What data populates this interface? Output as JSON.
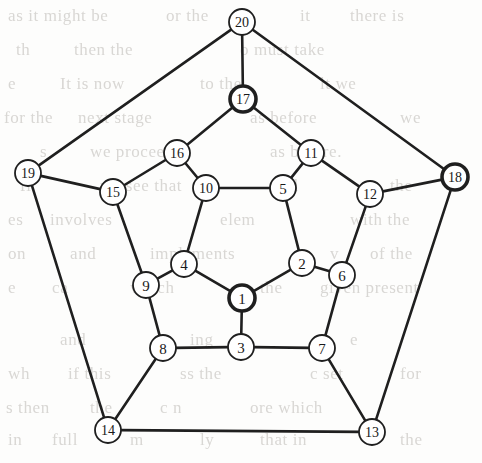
{
  "figure": {
    "width": 482,
    "height": 463,
    "background_color": "#fdfdfc",
    "edge_color": "#1f1f1f",
    "node_fill": "#ffffff",
    "node_stroke": "#1f1f1f",
    "label_color": "#1a1a1a"
  },
  "graph_data": {
    "type": "node-link-diagram",
    "node_count": 20,
    "edge_count": 30,
    "node_radius": 13,
    "highlighted_node_radius": 13,
    "nodes": [
      {
        "id": 1,
        "label": "1",
        "x": 242,
        "y": 298,
        "highlighted": true,
        "ring": "inner"
      },
      {
        "id": 2,
        "label": "2",
        "x": 302,
        "y": 263,
        "highlighted": false,
        "ring": "inner"
      },
      {
        "id": 3,
        "label": "3",
        "x": 241,
        "y": 347,
        "highlighted": false,
        "ring": "middle"
      },
      {
        "id": 4,
        "label": "4",
        "x": 184,
        "y": 264,
        "highlighted": false,
        "ring": "inner"
      },
      {
        "id": 5,
        "label": "5",
        "x": 283,
        "y": 188,
        "highlighted": false,
        "ring": "inner"
      },
      {
        "id": 6,
        "label": "6",
        "x": 342,
        "y": 275,
        "highlighted": false,
        "ring": "middle"
      },
      {
        "id": 7,
        "label": "7",
        "x": 322,
        "y": 348,
        "highlighted": false,
        "ring": "middle"
      },
      {
        "id": 8,
        "label": "8",
        "x": 163,
        "y": 348,
        "highlighted": false,
        "ring": "middle"
      },
      {
        "id": 9,
        "label": "9",
        "x": 146,
        "y": 285,
        "highlighted": false,
        "ring": "middle"
      },
      {
        "id": 10,
        "label": "10",
        "x": 206,
        "y": 188,
        "highlighted": false,
        "ring": "inner"
      },
      {
        "id": 11,
        "label": "11",
        "x": 311,
        "y": 153,
        "highlighted": false,
        "ring": "middle"
      },
      {
        "id": 12,
        "label": "12",
        "x": 370,
        "y": 194,
        "highlighted": false,
        "ring": "middle"
      },
      {
        "id": 13,
        "label": "13",
        "x": 372,
        "y": 432,
        "highlighted": false,
        "ring": "outer"
      },
      {
        "id": 14,
        "label": "14",
        "x": 108,
        "y": 430,
        "highlighted": false,
        "ring": "outer"
      },
      {
        "id": 15,
        "label": "15",
        "x": 113,
        "y": 192,
        "highlighted": false,
        "ring": "middle"
      },
      {
        "id": 16,
        "label": "16",
        "x": 177,
        "y": 153,
        "highlighted": false,
        "ring": "middle"
      },
      {
        "id": 17,
        "label": "17",
        "x": 243,
        "y": 99,
        "highlighted": true,
        "ring": "outer"
      },
      {
        "id": 18,
        "label": "18",
        "x": 455,
        "y": 177,
        "highlighted": true,
        "ring": "outer"
      },
      {
        "id": 19,
        "label": "19",
        "x": 28,
        "y": 173,
        "highlighted": false,
        "ring": "outer"
      },
      {
        "id": 20,
        "label": "20",
        "x": 242,
        "y": 22,
        "highlighted": false,
        "ring": "outer"
      }
    ],
    "edges": [
      {
        "source": 1,
        "target": 2
      },
      {
        "source": 1,
        "target": 3
      },
      {
        "source": 1,
        "target": 4
      },
      {
        "source": 2,
        "target": 5
      },
      {
        "source": 2,
        "target": 6
      },
      {
        "source": 3,
        "target": 7
      },
      {
        "source": 3,
        "target": 8
      },
      {
        "source": 4,
        "target": 9
      },
      {
        "source": 4,
        "target": 10
      },
      {
        "source": 5,
        "target": 10
      },
      {
        "source": 5,
        "target": 11
      },
      {
        "source": 6,
        "target": 7
      },
      {
        "source": 6,
        "target": 12
      },
      {
        "source": 7,
        "target": 13
      },
      {
        "source": 8,
        "target": 9
      },
      {
        "source": 8,
        "target": 14
      },
      {
        "source": 9,
        "target": 15
      },
      {
        "source": 10,
        "target": 16
      },
      {
        "source": 11,
        "target": 12
      },
      {
        "source": 11,
        "target": 17
      },
      {
        "source": 12,
        "target": 18
      },
      {
        "source": 13,
        "target": 14
      },
      {
        "source": 13,
        "target": 18
      },
      {
        "source": 14,
        "target": 19
      },
      {
        "source": 15,
        "target": 16
      },
      {
        "source": 15,
        "target": 19
      },
      {
        "source": 16,
        "target": 17
      },
      {
        "source": 17,
        "target": 20
      },
      {
        "source": 18,
        "target": 20
      },
      {
        "source": 19,
        "target": 20
      }
    ],
    "highlighted_nodes": [
      1,
      17,
      18
    ]
  },
  "background_text": {
    "description": "faint show-through text from the reverse side of the scanned page",
    "lines": [
      {
        "text": "as it might be",
        "x": 8,
        "y": 6
      },
      {
        "text": "or the",
        "x": 166,
        "y": 6
      },
      {
        "text": "it",
        "x": 300,
        "y": 6
      },
      {
        "text": "there is",
        "x": 350,
        "y": 6
      },
      {
        "text": "th",
        "x": 16,
        "y": 40
      },
      {
        "text": "then the",
        "x": 74,
        "y": 40
      },
      {
        "text": "o must take",
        "x": 240,
        "y": 40
      },
      {
        "text": "e",
        "x": 8,
        "y": 74
      },
      {
        "text": "It is now",
        "x": 60,
        "y": 74
      },
      {
        "text": "to the",
        "x": 200,
        "y": 74
      },
      {
        "text": "lt we",
        "x": 320,
        "y": 74
      },
      {
        "text": "for the",
        "x": 4,
        "y": 108
      },
      {
        "text": "next stage",
        "x": 78,
        "y": 108
      },
      {
        "text": "as before",
        "x": 250,
        "y": 108
      },
      {
        "text": "we",
        "x": 400,
        "y": 108
      },
      {
        "text": "s",
        "x": 40,
        "y": 142
      },
      {
        "text": "we proceed",
        "x": 90,
        "y": 142
      },
      {
        "text": "as before.",
        "x": 270,
        "y": 142
      },
      {
        "text": "fi",
        "x": 20,
        "y": 176
      },
      {
        "text": "we see that",
        "x": 100,
        "y": 176
      },
      {
        "text": "all",
        "x": 280,
        "y": 176
      },
      {
        "text": "the",
        "x": 390,
        "y": 176
      },
      {
        "text": "es",
        "x": 8,
        "y": 210
      },
      {
        "text": "involves",
        "x": 50,
        "y": 210
      },
      {
        "text": "elem",
        "x": 220,
        "y": 210
      },
      {
        "text": "with the",
        "x": 350,
        "y": 210
      },
      {
        "text": "on",
        "x": 8,
        "y": 244
      },
      {
        "text": "and",
        "x": 70,
        "y": 244
      },
      {
        "text": "implements",
        "x": 150,
        "y": 244
      },
      {
        "text": "v",
        "x": 330,
        "y": 244
      },
      {
        "text": "of  the",
        "x": 370,
        "y": 244
      },
      {
        "text": "e",
        "x": 8,
        "y": 278
      },
      {
        "text": "ca",
        "x": 52,
        "y": 278
      },
      {
        "text": "which",
        "x": 130,
        "y": 278
      },
      {
        "text": "the",
        "x": 260,
        "y": 278
      },
      {
        "text": "given present",
        "x": 320,
        "y": 278
      },
      {
        "text": "and",
        "x": 60,
        "y": 330
      },
      {
        "text": "ing",
        "x": 190,
        "y": 330
      },
      {
        "text": "e",
        "x": 350,
        "y": 330
      },
      {
        "text": "wh",
        "x": 8,
        "y": 364
      },
      {
        "text": "if this",
        "x": 68,
        "y": 364
      },
      {
        "text": "ss the",
        "x": 180,
        "y": 364
      },
      {
        "text": "c set",
        "x": 310,
        "y": 364
      },
      {
        "text": "for",
        "x": 400,
        "y": 364
      },
      {
        "text": "s then",
        "x": 6,
        "y": 398
      },
      {
        "text": "the",
        "x": 90,
        "y": 398
      },
      {
        "text": "c  n",
        "x": 160,
        "y": 398
      },
      {
        "text": "ore  which",
        "x": 250,
        "y": 398
      },
      {
        "text": "in",
        "x": 8,
        "y": 430
      },
      {
        "text": "full",
        "x": 52,
        "y": 430
      },
      {
        "text": "m",
        "x": 130,
        "y": 430
      },
      {
        "text": "ly",
        "x": 200,
        "y": 430
      },
      {
        "text": "that in",
        "x": 260,
        "y": 430
      },
      {
        "text": "the",
        "x": 400,
        "y": 430
      }
    ]
  }
}
